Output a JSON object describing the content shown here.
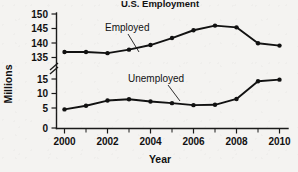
{
  "chart_data": {
    "type": "line",
    "title": "U.S. Employment",
    "xlabel": "Year",
    "ylabel": "Millions",
    "x": [
      2000,
      2001,
      2002,
      2003,
      2004,
      2005,
      2006,
      2007,
      2008,
      2009,
      2010
    ],
    "categories": [
      "2000",
      "2001",
      "2002",
      "2003",
      "2004",
      "2005",
      "2006",
      "2007",
      "2008",
      "2009",
      "2010"
    ],
    "series": [
      {
        "name": "Employed",
        "values": [
          136.9,
          136.9,
          136.5,
          137.7,
          139.3,
          141.7,
          144.4,
          146.0,
          145.4,
          139.9,
          139.1
        ]
      },
      {
        "name": "Unemployed",
        "values": [
          5.7,
          6.8,
          8.4,
          8.8,
          8.1,
          7.6,
          7.0,
          7.1,
          8.9,
          14.3,
          14.8
        ]
      }
    ],
    "xlim": [
      2000,
      2010
    ],
    "x_tick_labels": [
      "2000",
      "2002",
      "2004",
      "2006",
      "2008",
      "2010"
    ],
    "x_minor_ticks_every": 1,
    "y_axis_broken": true,
    "y_segment_lower": [
      0,
      15
    ],
    "y_segment_upper": [
      135,
      150
    ],
    "y_ticks_lower": [
      "0",
      "5",
      "10",
      "15"
    ],
    "y_ticks_upper": [
      "135",
      "140",
      "145",
      "150"
    ],
    "grid": false,
    "legend_position": "inline-annotations",
    "annotations": [
      {
        "text": "Employed",
        "points_to_year": 2003
      },
      {
        "text": "Unemployed",
        "points_to_year": 2006
      }
    ],
    "marker": "filled-circle",
    "line_color": "#111111"
  }
}
